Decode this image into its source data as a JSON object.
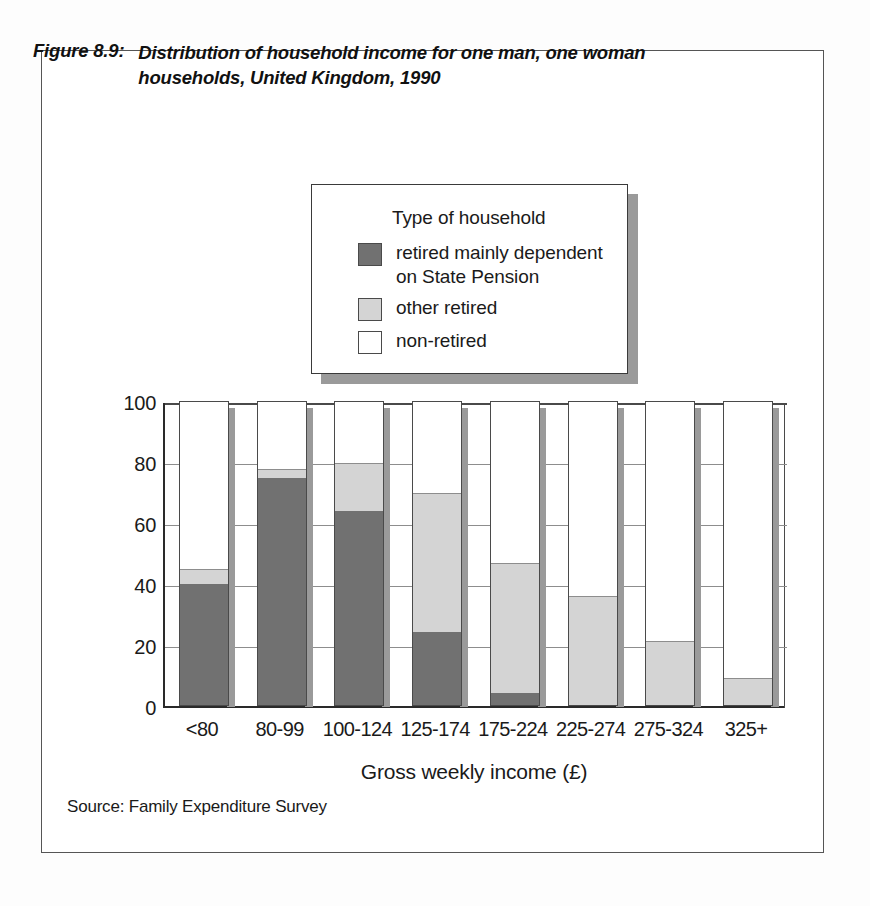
{
  "figure": {
    "number": "Figure 8.9:",
    "title": "Distribution of household income for one man, one woman households, United Kingdom, 1990",
    "source": "Source: Family Expenditure Survey"
  },
  "legend": {
    "heading": "Type of household",
    "items": [
      {
        "label": "retired mainly dependent on State Pension",
        "color": "#717171",
        "key": "retired-state-pension"
      },
      {
        "label": "other retired",
        "color": "#d4d4d4",
        "key": "other-retired"
      },
      {
        "label": "non-retired",
        "color": "#ffffff",
        "key": "non-retired"
      }
    ]
  },
  "chart_data": {
    "type": "bar",
    "stacked": true,
    "title": "Distribution of household income for one man, one woman households, United Kingdom, 1990",
    "xlabel": "Gross  weekly  income  (£)",
    "ylabel": "Percentage distribution",
    "ylim": [
      0,
      100
    ],
    "yticks": [
      "0",
      "20",
      "40",
      "60",
      "80",
      "100"
    ],
    "grid": true,
    "legend_position": "above-plot",
    "categories": [
      "<80",
      "80-99",
      "100-124",
      "125-174",
      "175-224",
      "225-274",
      "275-324",
      "325+"
    ],
    "series": [
      {
        "name": "retired mainly dependent on State Pension",
        "color": "#717171",
        "values": [
          40,
          75,
          64,
          24,
          4,
          0,
          0,
          0
        ]
      },
      {
        "name": "other retired",
        "color": "#d4d4d4",
        "values": [
          5,
          3,
          16,
          46,
          43,
          36,
          21,
          9
        ]
      },
      {
        "name": "non-retired",
        "color": "#ffffff",
        "values": [
          55,
          22,
          20,
          30,
          53,
          64,
          79,
          91
        ]
      }
    ]
  }
}
